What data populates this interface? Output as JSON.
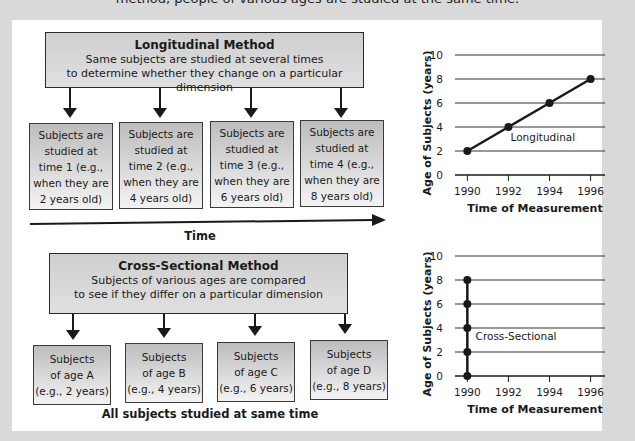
{
  "caption_partial": "method, people of various ages are studied at the same time.",
  "longitudinal": {
    "title": "Longitudinal Method",
    "line1": "Same subjects are studied at several times",
    "line2": "to determine whether they change on a particular dimension",
    "boxes": [
      "Subjects are\nstudied at\ntime 1 (e.g.,\nwhen they are\n2 years old)",
      "Subjects are\nstudied at\ntime 2 (e.g.,\nwhen they are\n4 years old)",
      "Subjects are\nstudied at\ntime 3 (e.g.,\nwhen they are\n6 years old)",
      "Subjects are\nstudied at\ntime 4 (e.g.,\nwhen they are\n8 years old)"
    ],
    "time_label": "Time"
  },
  "cross_sectional": {
    "title": "Cross-Sectional Method",
    "line1": "Subjects of various ages are compared",
    "line2": "to see if they differ on a particular dimension",
    "boxes": [
      "Subjects\nof age A\n(e.g., 2 years)",
      "Subjects\nof age B\n(e.g., 4 years)",
      "Subjects\nof age C\n(e.g., 6 years)",
      "Subjects\nof age D\n(e.g., 8 years)"
    ],
    "footer": "All subjects studied at same time"
  },
  "chart_data": [
    {
      "type": "line",
      "title": "",
      "series_label": "Longitudinal",
      "xlabel": "Time of Measurement",
      "ylabel": "Age of Subjects (years)",
      "x_ticks": [
        1990,
        1992,
        1994,
        1996
      ],
      "y_ticks": [
        0,
        2,
        4,
        6,
        8,
        10
      ],
      "xlim": [
        1989.4,
        1996.7
      ],
      "ylim": [
        0,
        10
      ],
      "grid": true,
      "points": [
        {
          "x": 1990,
          "y": 2
        },
        {
          "x": 1992,
          "y": 4
        },
        {
          "x": 1994,
          "y": 6
        },
        {
          "x": 1996,
          "y": 8
        }
      ]
    },
    {
      "type": "line",
      "title": "",
      "series_label": "Cross-Sectional",
      "xlabel": "Time of Measurement",
      "ylabel": "Age of Subjects (years)",
      "x_ticks": [
        1990,
        1992,
        1994,
        1996
      ],
      "y_ticks": [
        0,
        2,
        4,
        6,
        8,
        10
      ],
      "xlim": [
        1989.4,
        1996.7
      ],
      "ylim": [
        0,
        10
      ],
      "grid": true,
      "points": [
        {
          "x": 1990,
          "y": 0
        },
        {
          "x": 1990,
          "y": 2
        },
        {
          "x": 1990,
          "y": 4
        },
        {
          "x": 1990,
          "y": 6
        },
        {
          "x": 1990,
          "y": 8
        }
      ]
    }
  ]
}
